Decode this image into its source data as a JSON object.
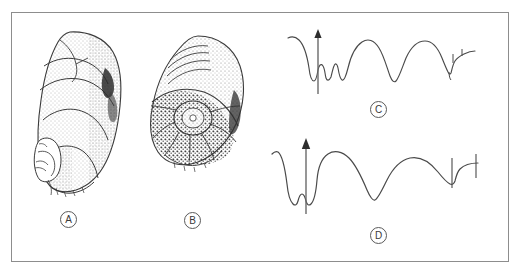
{
  "plate": {
    "background_color": "#ffffff",
    "border_color": "#8d8d8d",
    "ink_color": "#3a3a3a",
    "width": 522,
    "height": 274
  },
  "panels": [
    {
      "key": "A",
      "label": "A",
      "kind": "specimen-drawing",
      "subject": "fossil ammonite shell, lateral view with stippled shading",
      "label_position": {
        "x": 69,
        "y": 220
      }
    },
    {
      "key": "B",
      "label": "B",
      "kind": "specimen-drawing",
      "subject": "fossil ammonite shell, apertural view with coarse stipple and umbilicus",
      "label_position": {
        "x": 192,
        "y": 221
      }
    },
    {
      "key": "C",
      "label": "C",
      "kind": "suture-line",
      "subject": "ammonite suture line with ventral arrow marker",
      "label_position": {
        "x": 378,
        "y": 110
      }
    },
    {
      "key": "D",
      "label": "D",
      "kind": "suture-line",
      "subject": "ammonite suture line with ventral arrow marker",
      "label_position": {
        "x": 378,
        "y": 236
      }
    }
  ],
  "markers": {
    "venter_arrow_label": "venter-arrow",
    "arrow_count": 2
  }
}
